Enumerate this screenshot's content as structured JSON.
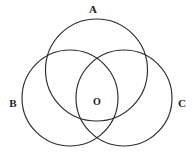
{
  "figure": {
    "name": "three-intersecting-circles",
    "background_color": "#ffffff",
    "stroke_color": "#2b2b2b",
    "label_color": "#1c1c1c",
    "width": 195,
    "height": 153
  },
  "labels": {
    "circle_a": "A",
    "circle_b": "B",
    "circle_c": "C",
    "center_point": "O"
  },
  "chart_data": {
    "type": "diagram",
    "subtype": "venn-three-circle",
    "title": "",
    "xlabel": "",
    "ylabel": "",
    "grid": false,
    "legend": false,
    "axis_ranges": {
      "x": [
        0,
        195
      ],
      "y": [
        0,
        153
      ]
    },
    "circles": [
      {
        "id": "A",
        "label": "A",
        "cx": 96.5,
        "cy": 70,
        "r": 51,
        "label_x": 93,
        "label_y": 9
      },
      {
        "id": "B",
        "label": "B",
        "cx": 70,
        "cy": 98,
        "r": 48,
        "label_x": 13,
        "label_y": 103
      },
      {
        "id": "C",
        "label": "C",
        "cx": 124,
        "cy": 98,
        "r": 48,
        "label_x": 182,
        "label_y": 103
      }
    ],
    "points": [
      {
        "id": "O",
        "label": "O",
        "x": 97,
        "y": 102
      }
    ],
    "annotations": [
      "Circle A is the upper circle, labeled above its apex.",
      "Circle B is the lower-left circle, labeled outside its left edge.",
      "Circle C is the lower-right circle, labeled outside its right edge.",
      "Point O marks the common central region where all three circles overlap."
    ]
  }
}
